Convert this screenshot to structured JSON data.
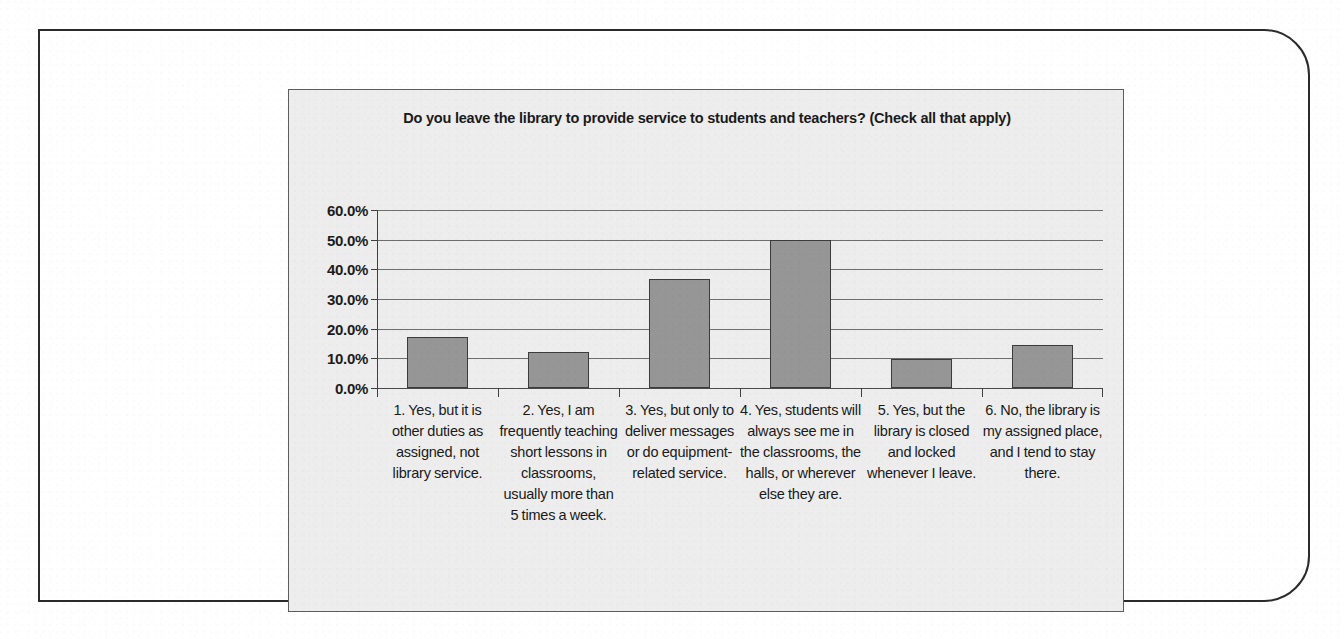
{
  "chart_data": {
    "type": "bar",
    "title": "Do you leave the library to provide service to students and teachers? (Check all that apply)",
    "xlabel": "",
    "ylabel": "",
    "ylim": [
      0,
      60
    ],
    "ytick_labels": [
      "60.0%",
      "50.0%",
      "40.0%",
      "30.0%",
      "20.0%",
      "10.0%",
      "0.0%"
    ],
    "ytick_values": [
      60,
      50,
      40,
      30,
      20,
      10,
      0
    ],
    "grid": true,
    "legend": false,
    "value_suffix": "%",
    "categories": [
      "1. Yes, but it is other duties as assigned, not library service.",
      "2. Yes, I am frequently teaching short lessons in classrooms, usually more than 5 times a week.",
      "3. Yes, but only to deliver messages or do equipment-related service.",
      "4. Yes, students will always see me in the classrooms, the halls, or wherever else they are.",
      "5. Yes, but the library is closed and locked whenever I leave.",
      "6. No, the library is my assigned place, and I tend to stay there."
    ],
    "values": [
      17.1,
      12.2,
      36.6,
      50.0,
      9.8,
      14.6
    ],
    "bar_color": "#969696",
    "bar_border_color": "#3c3c3c",
    "plot_background": "#ededed",
    "gridline_color": "#6e6e6e"
  }
}
